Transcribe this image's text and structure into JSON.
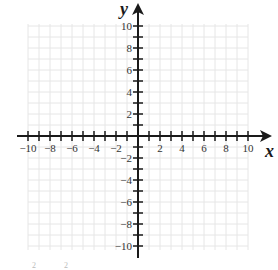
{
  "diagram": {
    "type": "coordinate-plane",
    "x_axis": {
      "label": "x",
      "min": -10,
      "max": 10,
      "tick_step": 1,
      "label_step": 2,
      "tick_labels": [
        "−10",
        "−8",
        "−6",
        "−4",
        "−2",
        "2",
        "4",
        "6",
        "8",
        "10"
      ]
    },
    "y_axis": {
      "label": "y",
      "min": -10,
      "max": 10,
      "tick_step": 1,
      "label_step": 2,
      "tick_labels": [
        "10",
        "8",
        "6",
        "4",
        "2",
        "−2",
        "−4",
        "−6",
        "−8",
        "−10"
      ]
    },
    "grid": {
      "visible": true,
      "step": 1,
      "color": "#e6e6e6"
    },
    "colors": {
      "axis": "#1a1a1a",
      "grid": "#e6e6e6",
      "labels": "#333333"
    },
    "faint_marks": [
      "2",
      "2"
    ]
  }
}
